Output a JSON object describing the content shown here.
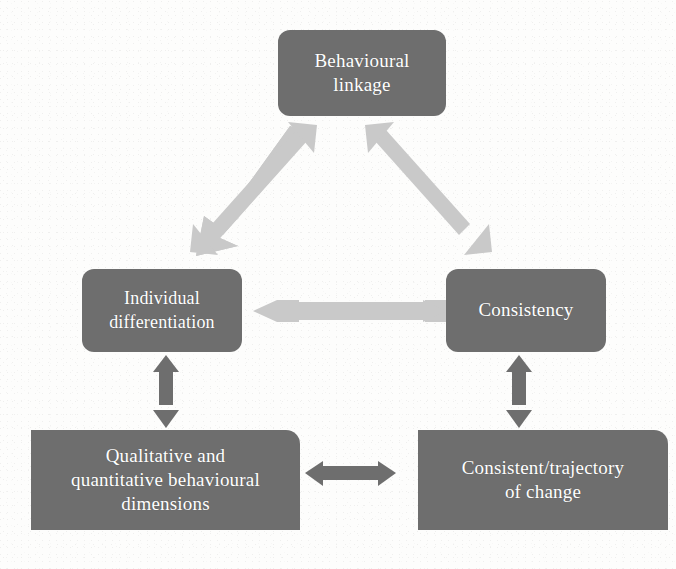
{
  "figure": {
    "type": "flow-diagram",
    "background_color": "#fdfdfc",
    "node_fill_color": "#6e6e6e",
    "node_text_color": "#ffffff",
    "light_arrow_color": "#c9c9c9",
    "dark_arrow_color": "#6e6e6e"
  },
  "nodes": [
    {
      "id": "behavioural-linkage",
      "label": "Behavioural\nlinkage"
    },
    {
      "id": "individual-differentiation",
      "label": "Individual\ndifferentiation"
    },
    {
      "id": "consistency",
      "label": "Consistency"
    },
    {
      "id": "qualitative-quantitative",
      "label": "Qualitative and\nquantitative behavioural\ndimensions"
    },
    {
      "id": "consistent-trajectory",
      "label": "Consistent/trajectory\nof change"
    }
  ],
  "connectors": [
    {
      "id": "behavioural-linkage-to-individual-differentiation",
      "from": "behavioural-linkage",
      "to": "individual-differentiation",
      "style": "double-headed",
      "orientation": "diagonal-down-left",
      "color": "#c9c9c9"
    },
    {
      "id": "behavioural-linkage-to-consistency",
      "from": "behavioural-linkage",
      "to": "consistency",
      "style": "double-headed",
      "orientation": "diagonal-down-right",
      "color": "#c9c9c9"
    },
    {
      "id": "individual-differentiation-to-consistency",
      "from": "individual-differentiation",
      "to": "consistency",
      "style": "double-headed",
      "orientation": "horizontal",
      "color": "#c9c9c9"
    },
    {
      "id": "individual-differentiation-to-qualitative-quantitative",
      "from": "individual-differentiation",
      "to": "qualitative-quantitative",
      "style": "double-headed",
      "orientation": "vertical",
      "color": "#6e6e6e"
    },
    {
      "id": "consistency-to-consistent-trajectory",
      "from": "consistency",
      "to": "consistent-trajectory",
      "style": "double-headed",
      "orientation": "vertical",
      "color": "#6e6e6e"
    },
    {
      "id": "qualitative-quantitative-to-consistent-trajectory",
      "from": "qualitative-quantitative",
      "to": "consistent-trajectory",
      "style": "double-headed",
      "orientation": "horizontal",
      "color": "#6e6e6e"
    }
  ]
}
